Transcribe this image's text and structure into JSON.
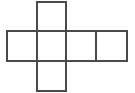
{
  "figure": {
    "name": "cube-net",
    "shape_type": "net",
    "solid": "cube",
    "square_count": 6,
    "colors": {
      "background": "#ffffff",
      "stroke": "#4a4a4a",
      "fill": "#ffffff"
    },
    "stroke_width": 2,
    "geometry": {
      "cell_size": 30,
      "column_edges": [
        7,
        37,
        66,
        96,
        127
      ],
      "row_edges": [
        2,
        31,
        61,
        91
      ],
      "grid_columns": 4,
      "grid_rows": 3
    },
    "squares": [
      {
        "id": "square-top",
        "label": "",
        "col": 2,
        "row": 1,
        "x": 37,
        "y": 2,
        "w": 29,
        "h": 29
      },
      {
        "id": "square-middle-1",
        "label": "",
        "col": 1,
        "row": 2,
        "x": 7,
        "y": 31,
        "w": 30,
        "h": 30
      },
      {
        "id": "square-middle-2",
        "label": "",
        "col": 2,
        "row": 2,
        "x": 37,
        "y": 31,
        "w": 29,
        "h": 30
      },
      {
        "id": "square-middle-3",
        "label": "",
        "col": 3,
        "row": 2,
        "x": 66,
        "y": 31,
        "w": 30,
        "h": 30
      },
      {
        "id": "square-middle-4",
        "label": "",
        "col": 4,
        "row": 2,
        "x": 96,
        "y": 31,
        "w": 31,
        "h": 30
      },
      {
        "id": "square-bottom",
        "label": "",
        "col": 2,
        "row": 3,
        "x": 37,
        "y": 61,
        "w": 29,
        "h": 30
      }
    ]
  }
}
